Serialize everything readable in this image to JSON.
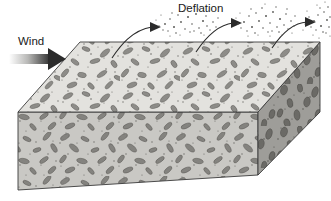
{
  "figure": {
    "background_color": "#ffffff"
  },
  "labels": {
    "wind": "Wind",
    "deflation": "Deflation"
  },
  "colors": {
    "top_face": "#e3e2de",
    "front_face": "#c9c8c4",
    "right_face": "#9e9d99",
    "outline": "#3a3a3a",
    "clast_top": "#8d8c88",
    "clast_front": "#84837f",
    "clast_right": "#6b6a66",
    "speck": "#6e6d69",
    "arrow_dark": "#2b2b2b",
    "arrow_light": "#ffffff",
    "dust": "#5a5a57",
    "text": "#1a1a1a"
  },
  "wind_arrow": {
    "name": "wind-arrow",
    "direction": "right",
    "x_start": 9,
    "x_end": 62,
    "y_center": 59,
    "gradient": "white-to-dark"
  },
  "deflation_arrows": [
    {
      "name": "deflation-arrow-1",
      "start_x": 112,
      "start_y": 58,
      "end_x": 157,
      "end_y": 27
    },
    {
      "name": "deflation-arrow-2",
      "start_x": 196,
      "start_y": 52,
      "end_x": 238,
      "end_y": 23
    },
    {
      "name": "deflation-arrow-3",
      "start_x": 272,
      "start_y": 48,
      "end_x": 312,
      "end_y": 22
    }
  ],
  "dust_clouds": [
    {
      "name": "dust-cloud-1",
      "cx": 183,
      "cy": 22,
      "count": 34
    },
    {
      "name": "dust-cloud-2",
      "cx": 259,
      "cy": 19,
      "count": 36
    },
    {
      "name": "dust-cloud-3",
      "cx": 322,
      "cy": 18,
      "count": 22
    }
  ],
  "block": {
    "name": "desert-pavement-block",
    "top_face": {
      "name": "top-face",
      "points": "18,112 80,42 320,42 258,112"
    },
    "front_face": {
      "name": "front-face",
      "points": "18,112 258,112 258,175 18,190"
    },
    "right_face": {
      "name": "right-face",
      "points": "258,112 320,42 320,112 258,175"
    }
  }
}
